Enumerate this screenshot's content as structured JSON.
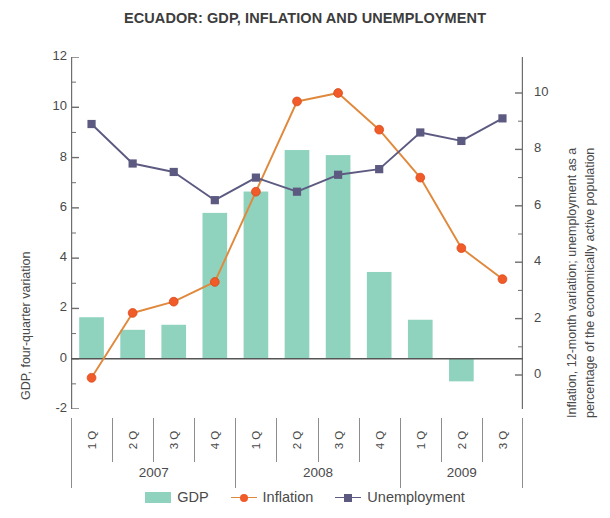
{
  "title": "ECUADOR: GDP, INFLATION AND UNEMPLOYMENT",
  "axes": {
    "y_left_title": "GDP, four-quarter variation",
    "y_right_title_line1": "Inflation, 12-month variation; unemployment as a",
    "y_right_title_line2": "percentage of the economically active population",
    "y_left_ticks": [
      "12",
      "10",
      "8",
      "6",
      "4",
      "2",
      "0",
      "-2"
    ],
    "y_right_ticks": [
      "10",
      "8",
      "6",
      "4",
      "2",
      "0"
    ]
  },
  "legend": {
    "items": [
      {
        "label": "GDP",
        "marker": "bar-swatch",
        "color": "#8fd3bf"
      },
      {
        "label": "Inflation",
        "marker": "circle-marker",
        "color": "#f15a29"
      },
      {
        "label": "Unemployment",
        "marker": "square-marker",
        "color": "#5d5a82"
      }
    ]
  },
  "colors": {
    "gdp_bar": "#8fd3bf",
    "inflation": "#f15a29",
    "inflation_line": "#e0883c",
    "unemployment": "#5d5a82",
    "axis": "#6e6e6e",
    "text": "#4a4a4a"
  },
  "x_axis": {
    "quarters": [
      "1 Q",
      "2 Q",
      "3 Q",
      "4 Q",
      "1 Q",
      "2 Q",
      "3 Q",
      "4 Q",
      "1 Q",
      "2 Q",
      "3 Q"
    ],
    "years": [
      {
        "label": "2007",
        "span": 4
      },
      {
        "label": "2008",
        "span": 4
      },
      {
        "label": "2009",
        "span": 3
      }
    ]
  },
  "chart_data": {
    "type": "bar",
    "title": "ECUADOR: GDP, INFLATION AND UNEMPLOYMENT",
    "xlabel": "",
    "ylabel": "GDP, four-quarter variation",
    "y2label": "Inflation, 12-month variation; unemployment as a percentage of the economically active population",
    "categories": [
      "2007 1 Q",
      "2007 2 Q",
      "2007 3 Q",
      "2007 4 Q",
      "2008 1 Q",
      "2008 2 Q",
      "2008 3 Q",
      "2008 4 Q",
      "2009 1 Q",
      "2009 2 Q",
      "2009 3 Q"
    ],
    "ylim": [
      -2,
      12
    ],
    "y2lim": [
      0,
      10
    ],
    "grid": false,
    "legend_position": "bottom",
    "series": [
      {
        "name": "GDP",
        "type": "bar",
        "axis": "left",
        "color": "#8fd3bf",
        "values": [
          1.65,
          1.15,
          1.35,
          5.8,
          6.65,
          8.3,
          8.1,
          3.45,
          1.55,
          -0.9,
          null
        ]
      },
      {
        "name": "Inflation",
        "type": "line",
        "axis": "right",
        "color": "#f15a29",
        "marker": "circle",
        "values": [
          -0.1,
          2.2,
          2.6,
          3.3,
          6.5,
          9.7,
          10.0,
          8.7,
          7.0,
          4.5,
          3.4
        ]
      },
      {
        "name": "Unemployment",
        "type": "line",
        "axis": "right",
        "color": "#5d5a82",
        "marker": "square",
        "values": [
          8.9,
          7.5,
          7.2,
          6.2,
          7.0,
          6.5,
          7.1,
          7.3,
          8.6,
          8.3,
          9.1
        ]
      }
    ]
  }
}
